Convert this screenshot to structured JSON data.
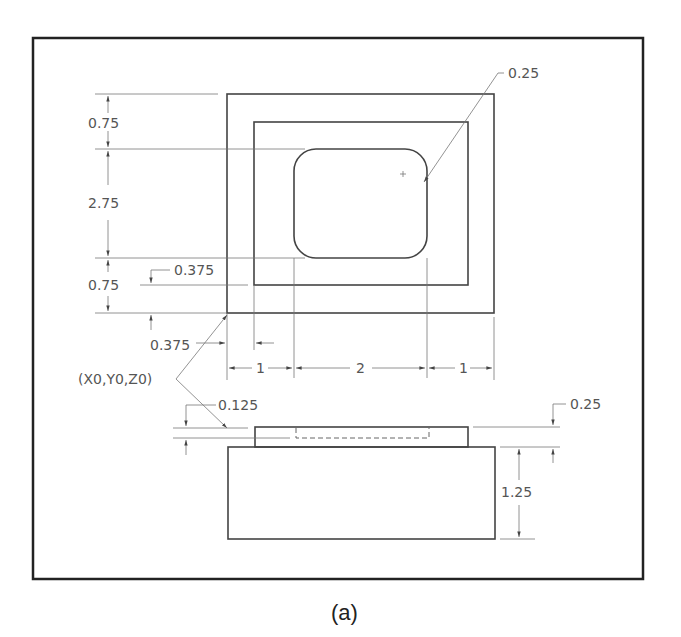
{
  "figure": {
    "caption": "(a)",
    "top_view": {
      "dims": {
        "top_margin": "0.75",
        "pocket_height": "2.75",
        "bottom_margin": "0.75",
        "step_offset_y": "0.375",
        "step_offset_x": "0.375",
        "left_margin": "1",
        "pocket_width": "2",
        "right_margin": "1",
        "corner_radius": "0.25"
      }
    },
    "origin_label": "(X0,Y0,Z0)",
    "side_view": {
      "dims": {
        "pocket_depth": "0.125",
        "step_height": "0.25",
        "base_height": "1.25"
      }
    }
  }
}
